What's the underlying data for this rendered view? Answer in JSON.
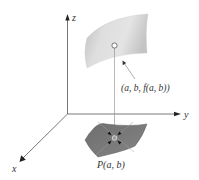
{
  "diagram": {
    "axes": {
      "z_label": "z",
      "y_label": "y",
      "x_label": "x"
    },
    "surface_point_label": "(a, b, f(a, b))",
    "base_point_label": "P(a, b)",
    "colors": {
      "axis": "#444444",
      "upper_surface_light": "#e6e6e6",
      "upper_surface_dark": "#b4b4b4",
      "lower_region": "#7a7a7a",
      "lower_region_edge": "#5e5e5e",
      "text": "#333333"
    }
  }
}
